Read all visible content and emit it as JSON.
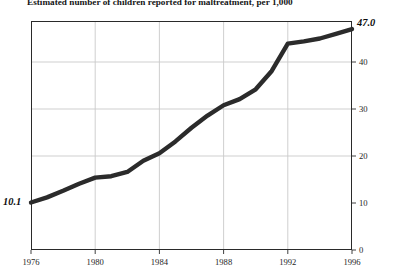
{
  "title": "Estimated number of children reported for maltreatment, per 1,000",
  "colors": {
    "line": "#2b2b2b",
    "frame": "#2a2a2a",
    "grid": "#c9c9c9",
    "text": "#1a1a1a",
    "background": "#ffffff"
  },
  "annotations": {
    "start_value": "10.1",
    "end_value": "47.0"
  },
  "chart_data": {
    "type": "line",
    "title": "Estimated number of children reported for maltreatment, per 1,000",
    "xlabel": "",
    "ylabel": "",
    "xlim": [
      1976,
      1996
    ],
    "ylim": [
      0,
      50
    ],
    "grid": true,
    "grid_axis": "both",
    "legend": "none",
    "yticks": [
      0,
      10,
      20,
      30,
      40
    ],
    "ytick_labels": [
      "0",
      "10",
      "20",
      "30",
      "40"
    ],
    "xticks": [
      1976,
      1980,
      1984,
      1988,
      1992,
      1996
    ],
    "xtick_labels": [
      "1976",
      "1980",
      "1984",
      "1988",
      "1992",
      "1996"
    ],
    "hgridlines": [
      20,
      30,
      40
    ],
    "vgridlines": [
      1980,
      1984,
      1988,
      1992
    ],
    "x": [
      1976,
      1977,
      1978,
      1979,
      1980,
      1981,
      1982,
      1983,
      1984,
      1985,
      1986,
      1987,
      1988,
      1989,
      1990,
      1991,
      1992,
      1993,
      1994,
      1995,
      1996
    ],
    "values": [
      10.1,
      11.2,
      12.6,
      14.1,
      15.4,
      15.7,
      16.6,
      19.0,
      20.6,
      23.1,
      26.0,
      28.6,
      30.8,
      32.1,
      34.2,
      38.1,
      43.9,
      44.4,
      45.0,
      46.0,
      47.0
    ],
    "annotations": [
      {
        "x": 1976,
        "y": 10.1,
        "label": "10.1",
        "position": "left"
      },
      {
        "x": 1996,
        "y": 47.0,
        "label": "47.0",
        "position": "right"
      }
    ]
  }
}
